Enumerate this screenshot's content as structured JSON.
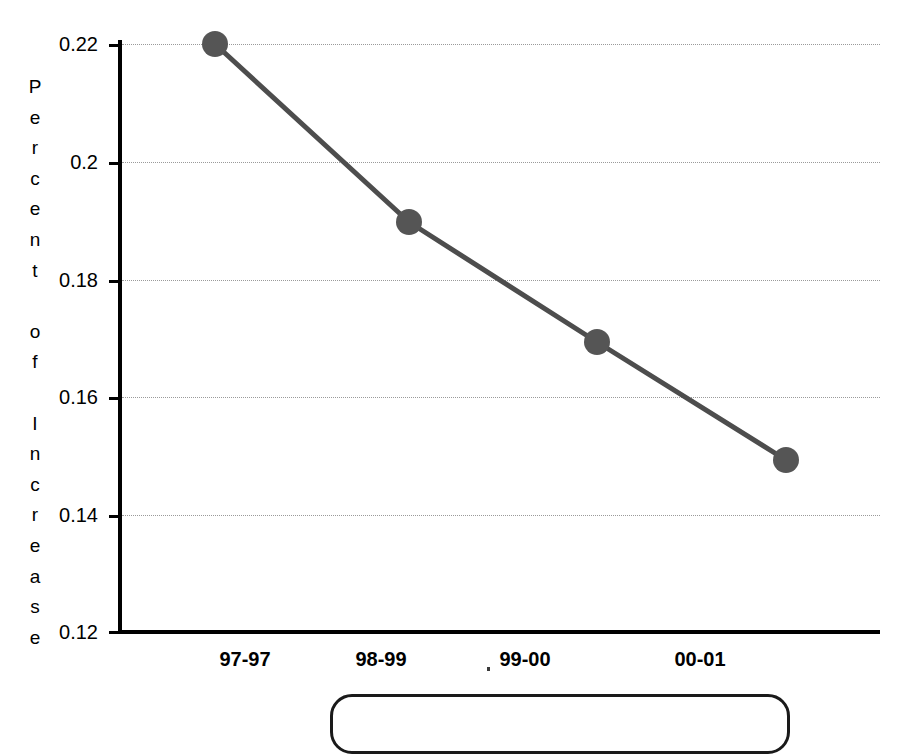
{
  "chart_data": {
    "type": "line",
    "title": "",
    "subtitle": "",
    "xlabel": "",
    "ylabel": "Percent of Increase",
    "ylabel_stacked": "P\ne\nr\nc\ne\nn\nt\n\no\nf\n\nI\nn\nc\nr\ne\na\ns\ne",
    "categories": [
      "97-97",
      "98-99",
      "99-00",
      "00-01"
    ],
    "x": [
      "97-97",
      "98-99",
      "99-00",
      "00-01"
    ],
    "values": [
      0.22,
      0.19,
      0.17,
      0.15
    ],
    "series": [
      {
        "name": "Percent of Increase",
        "values": [
          0.22,
          0.19,
          0.17,
          0.15
        ],
        "color": "#4d4d4d",
        "marker": "circle",
        "marker_color": "#555555"
      }
    ],
    "ylim": [
      0.12,
      0.22
    ],
    "ytick_labels": [
      "0.22",
      "0.2",
      "0.18",
      "0.16",
      "0.14",
      "0.12"
    ],
    "ytick_values": [
      0.22,
      0.2,
      0.18,
      0.16,
      0.14,
      0.12
    ],
    "grid": true,
    "grid_axis": "y",
    "grid_style": "dotted",
    "legend": false,
    "legend_position": "bottom"
  },
  "axes": {
    "y_ticks": [
      {
        "label": "0.22",
        "value": 0.22,
        "y": 44
      },
      {
        "label": "0.2",
        "value": 0.2,
        "y": 162
      },
      {
        "label": "0.18",
        "value": 0.18,
        "y": 280
      },
      {
        "label": "0.16",
        "value": 0.16,
        "y": 397
      },
      {
        "label": "0.14",
        "value": 0.14,
        "y": 515
      },
      {
        "label": "0.12",
        "value": 0.12,
        "y": 632
      }
    ],
    "x_ticks": [
      {
        "label": "97-97",
        "cx": 245
      },
      {
        "label": "98-99",
        "cx": 381
      },
      {
        "label": "99-00",
        "cx": 525
      },
      {
        "label": "00-01",
        "cx": 700
      }
    ]
  },
  "points": [
    {
      "label": "97-97",
      "value": "0.22",
      "cx": 215,
      "cy": 44
    },
    {
      "label": "98-99",
      "value": "0.19",
      "cx": 409,
      "cy": 222
    },
    {
      "label": "99-00",
      "value": "0.17",
      "cx": 597,
      "cy": 342
    },
    {
      "label": "00-01",
      "value": "0.15",
      "cx": 786,
      "cy": 460
    }
  ],
  "legend": {
    "label": ""
  },
  "colors": {
    "line": "#4d4d4d",
    "marker": "#555555",
    "axis": "#000000",
    "grid": "#9a9a9a",
    "text": "#000000",
    "background": "#ffffff"
  }
}
